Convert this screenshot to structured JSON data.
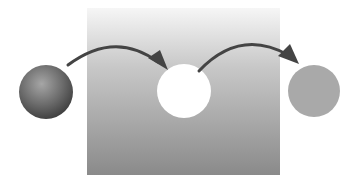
{
  "diagram": {
    "panel": {
      "x": 87,
      "y": 8,
      "width": 193,
      "height": 167,
      "gradient_top": "#f4f4f4",
      "gradient_bottom": "#8e8e8e"
    },
    "source_sphere": {
      "cx": 46,
      "cy": 92,
      "r": 27,
      "highlight": "#a8a8a8",
      "shadow": "#3c3c3c"
    },
    "hole": {
      "cx": 184,
      "cy": 91,
      "r": 27,
      "color": "#ffffff"
    },
    "result_circle": {
      "cx": 314,
      "cy": 91,
      "r": 26,
      "color": "#a9a9a9"
    },
    "arrow_color": "#444444",
    "arrows": [
      {
        "from": "source-sphere",
        "to": "hole"
      },
      {
        "from": "hole",
        "to": "result-circle"
      }
    ]
  }
}
